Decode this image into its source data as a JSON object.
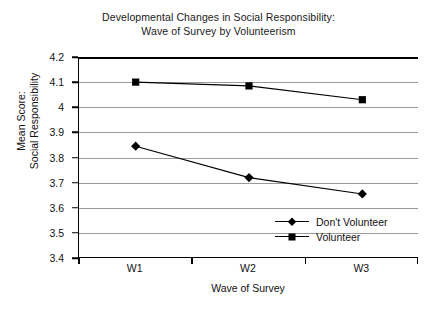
{
  "chart_data": {
    "type": "line",
    "title": "Developmental Changes in Social Responsibility: Wave of Survey by Volunteerism",
    "title_lines": [
      "Developmental Changes in Social Responsibility:",
      "Wave of Survey by Volunteerism"
    ],
    "xlabel": "Wave of Survey",
    "ylabel": "Mean Score: Social Responsibility",
    "ylabel_lines": [
      "Mean Score:",
      "Social Responsibility"
    ],
    "categories": [
      "W1",
      "W2",
      "W3"
    ],
    "ylim": [
      3.4,
      4.2
    ],
    "ytick_labels": [
      "4.2",
      "4.1",
      "4",
      "3.9",
      "3.8",
      "3.7",
      "3.6",
      "3.5",
      "3.4"
    ],
    "ytick_values": [
      4.2,
      4.1,
      4.0,
      3.9,
      3.8,
      3.7,
      3.6,
      3.5,
      3.4
    ],
    "grid": "horizontal",
    "legend_position": "inside-bottom-right",
    "series": [
      {
        "name": "Don't Volunteer",
        "marker": "diamond",
        "color": "#000000",
        "values": [
          3.845,
          3.72,
          3.655
        ]
      },
      {
        "name": "Volunteer",
        "marker": "square",
        "color": "#000000",
        "values": [
          4.1,
          4.085,
          4.03
        ]
      }
    ]
  },
  "caption": {
    "fragment": " "
  }
}
